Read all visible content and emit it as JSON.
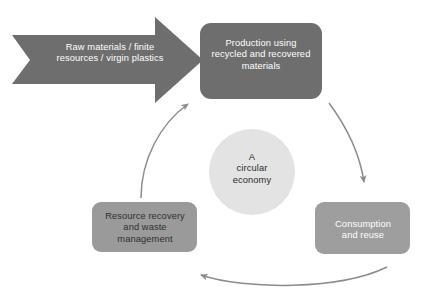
{
  "diagram": {
    "title": "A circular economy",
    "type": "cycle-diagram",
    "background_color": "#ffffff"
  },
  "colors": {
    "dark_gray": "#6e6e6e",
    "medium_gray": "#9a9a9a",
    "light_gray_box": "#9e9e9e",
    "circle_fill": "#e3e3e3",
    "arrow_stroke": "#8c8c8c",
    "text_on_dark": "#ffffff",
    "text_on_light": "#2b2b2b"
  },
  "inflow": {
    "name": "raw-materials-inflow",
    "shape": "chevron-arrow",
    "line1": "Raw materials / finite",
    "line2": "resources / virgin plastics"
  },
  "nodes": {
    "production": {
      "name": "production-node",
      "line1": "Production using",
      "line2": "recycled and recovered",
      "line3": "materials"
    },
    "consumption": {
      "name": "consumption-node",
      "line1": "Consumption",
      "line2": "and reuse"
    },
    "recovery": {
      "name": "resource-recovery-node",
      "line1": "Resource recovery",
      "line2": "and waste",
      "line3": "management"
    }
  },
  "core": {
    "name": "circular-economy-core",
    "line1": "A",
    "line2": "circular",
    "line3": "economy"
  },
  "flow_arrows": [
    {
      "name": "production-to-consumption-arrow",
      "from": "production",
      "to": "consumption",
      "direction": "clockwise-right"
    },
    {
      "name": "consumption-to-recovery-arrow",
      "from": "consumption",
      "to": "recovery",
      "direction": "clockwise-bottom"
    },
    {
      "name": "recovery-to-production-arrow",
      "from": "recovery",
      "to": "production",
      "direction": "clockwise-left"
    }
  ]
}
